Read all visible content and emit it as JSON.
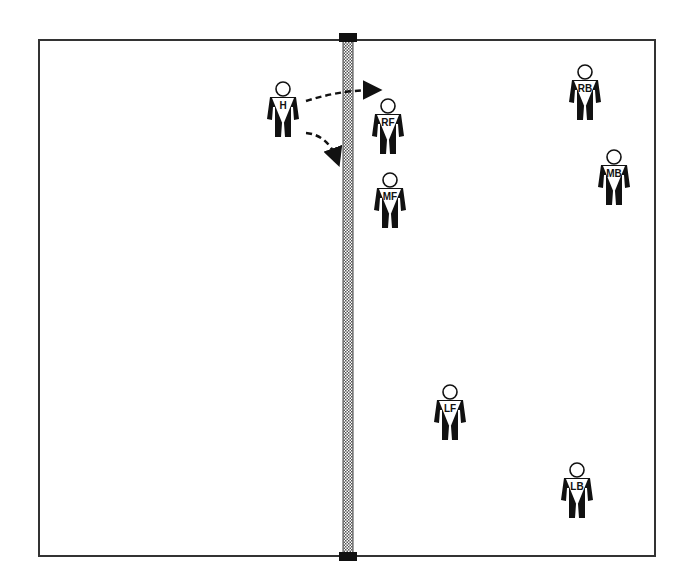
{
  "diagram": {
    "type": "volleyball-court",
    "court": {
      "x": 39,
      "y": 40,
      "width": 616,
      "height": 516,
      "line_color": "#333333"
    },
    "net": {
      "x": 343,
      "width": 10,
      "color": "#888888",
      "post_color": "#111111"
    },
    "players": [
      {
        "id": "H",
        "label": "H",
        "x": 283,
        "y": 93,
        "side": "left"
      },
      {
        "id": "RF",
        "label": "RF",
        "x": 388,
        "y": 110,
        "side": "right"
      },
      {
        "id": "MF",
        "label": "MF",
        "x": 390,
        "y": 184,
        "side": "right"
      },
      {
        "id": "RB",
        "label": "RB",
        "x": 585,
        "y": 76,
        "side": "right"
      },
      {
        "id": "MB",
        "label": "MB",
        "x": 614,
        "y": 161,
        "side": "right"
      },
      {
        "id": "LF",
        "label": "LF",
        "x": 450,
        "y": 396,
        "side": "right"
      },
      {
        "id": "LB",
        "label": "LB",
        "x": 577,
        "y": 474,
        "side": "right"
      }
    ],
    "arrows": [
      {
        "from": "H",
        "path": "M306,101 Q340,90 375,90",
        "style": "dashed"
      },
      {
        "from": "H",
        "path": "M306,133 Q328,135 337,160",
        "style": "dashed"
      }
    ]
  }
}
